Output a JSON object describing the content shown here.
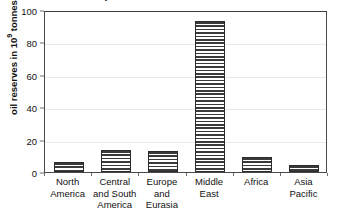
{
  "chart_data": {
    "type": "bar",
    "title": "proven oil reserves 2012",
    "categories": [
      "North America",
      "Central and South America",
      "Europe and Eurasia",
      "Middle East",
      "Africa",
      "Asia Pacific"
    ],
    "category_lines": [
      [
        "North",
        "America"
      ],
      [
        "Central",
        "and South",
        "America"
      ],
      [
        "Europe",
        "and",
        "Eurasia"
      ],
      [
        "Middle",
        "East"
      ],
      [
        "Africa"
      ],
      [
        "Asia",
        "Pacific"
      ]
    ],
    "values": [
      6,
      13.5,
      12.8,
      93,
      9.5,
      4.5
    ],
    "xlabel": "",
    "ylabel": "oil reserves in 10⁹ tonnes",
    "ylabel_prefix": "oil reserves in 10",
    "ylabel_exponent": "9",
    "ylabel_suffix": " tonnes",
    "ylim": [
      0,
      100
    ],
    "yticks": [
      0,
      20,
      40,
      60,
      80,
      100
    ],
    "ytick_labels": [
      "0",
      "20",
      "40",
      "60",
      "80",
      "100"
    ],
    "grid": true,
    "legend": false,
    "bar_fill": "horizontal-hatch",
    "colors": {
      "bar_line": "#3a3a3a",
      "bar_border": "#2b2b2b",
      "axis": "#4a4a4a",
      "gridline": "#e9e9e9",
      "text": "#111111",
      "background": "#ffffff"
    }
  }
}
